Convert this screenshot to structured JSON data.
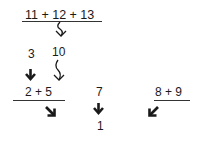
{
  "diagram": {
    "top_expression": "11 + 12 + 13",
    "split_left": "3",
    "split_right": "10",
    "middle_left_expression": "2 + 5",
    "middle_center_value": "7",
    "middle_right_expression": "8 + 9",
    "result_value": "1",
    "arrows": [
      {
        "name": "wavy-down-arrow-top",
        "style": "wavy"
      },
      {
        "name": "bold-down-arrow-left",
        "style": "bold"
      },
      {
        "name": "wavy-down-arrow-middle",
        "style": "wavy"
      },
      {
        "name": "bold-southeast-arrow",
        "style": "bold"
      },
      {
        "name": "bold-down-arrow-center",
        "style": "bold"
      },
      {
        "name": "bold-southwest-arrow",
        "style": "bold"
      }
    ],
    "colors": {
      "text": "#1a1a1a",
      "line": "#333333",
      "background": "#ffffff"
    }
  }
}
